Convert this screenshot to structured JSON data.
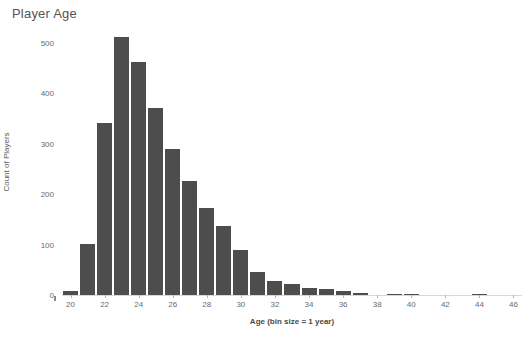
{
  "chart_data": {
    "type": "bar",
    "title": "Player Age",
    "xlabel": "Age (bin size = 1 year)",
    "ylabel": "Count of Players",
    "grid": false,
    "legend": null,
    "xlim": [
      19.5,
      46.5
    ],
    "ylim": [
      0,
      530
    ],
    "xtick_labels": [
      "20",
      "22",
      "24",
      "26",
      "28",
      "30",
      "32",
      "34",
      "36",
      "38",
      "40",
      "42",
      "44",
      "46"
    ],
    "xticks": [
      20,
      22,
      24,
      26,
      28,
      30,
      32,
      34,
      36,
      38,
      40,
      42,
      44,
      46
    ],
    "ytick_labels": [
      "0",
      "100",
      "200",
      "300",
      "400",
      "500"
    ],
    "yticks": [
      0,
      100,
      200,
      300,
      400,
      500
    ],
    "bin_size": 1,
    "categories": [
      20,
      21,
      22,
      23,
      24,
      25,
      26,
      27,
      28,
      29,
      30,
      31,
      32,
      33,
      34,
      35,
      36,
      37,
      38,
      39,
      40,
      41,
      42,
      43,
      44,
      45,
      46
    ],
    "values": [
      8,
      102,
      341,
      512,
      462,
      372,
      289,
      226,
      172,
      137,
      89,
      45,
      28,
      22,
      14,
      12,
      8,
      4,
      0,
      2,
      2,
      0,
      0,
      0,
      2,
      0,
      0
    ],
    "bar_color": "#4d4d4d"
  },
  "axis": {
    "y_title": "Count of Players",
    "x_title": "Age (bin size = 1 year)"
  },
  "title": "Player Age",
  "colors": {
    "bar": "#4d4d4d",
    "text": "#4a4a4a",
    "tick": "#6b6b6b",
    "axis_line": "#d9d9d9",
    "background": "#ffffff"
  }
}
